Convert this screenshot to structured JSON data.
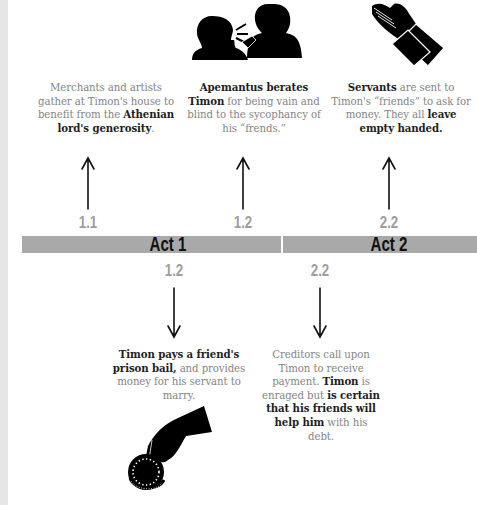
{
  "colors": {
    "act_bar": "#a9a9a9",
    "scene_number": "#9d9d9d",
    "body_text": "#858585",
    "emphasis_text": "#1e1e1e",
    "background": "#ffffff"
  },
  "acts": [
    {
      "label": "Act 1"
    },
    {
      "label": "Act 2"
    }
  ],
  "events_above": [
    {
      "scene": "1.1",
      "icon": "none",
      "parts": [
        {
          "text": "Merchants and artists gather at Timon's house to benefit from the ",
          "bold": false
        },
        {
          "text": "Athenian lord's generosity",
          "bold": true
        },
        {
          "text": ".",
          "bold": false
        }
      ]
    },
    {
      "scene": "1.2",
      "icon": "shouting-man-icon",
      "parts": [
        {
          "text": "Apemantus berates Timon",
          "bold": true
        },
        {
          "text": " for being vain and blind to the sycophancy of his “frends.”",
          "bold": false
        }
      ]
    },
    {
      "scene": "2.2",
      "icon": "begging-hands-icon",
      "parts": [
        {
          "text": "Servants",
          "bold": true
        },
        {
          "text": " are sent to Timon's “friends” to ask for money. They all ",
          "bold": false
        },
        {
          "text": "leave empty handed.",
          "bold": true
        }
      ]
    }
  ],
  "events_below": [
    {
      "scene": "1.2",
      "icon": "hand-with-coin-icon",
      "parts": [
        {
          "text": "Timon pays a friend's prison bail,",
          "bold": true
        },
        {
          "text": " and provides money for his servant to marry.",
          "bold": false
        }
      ]
    },
    {
      "scene": "2.2",
      "icon": "none",
      "parts": [
        {
          "text": "Creditors call upon Timon to receive payment. ",
          "bold": false
        },
        {
          "text": "Timon",
          "bold": true
        },
        {
          "text": " is enraged but ",
          "bold": false
        },
        {
          "text": "is certain that his friends will help him",
          "bold": true
        },
        {
          "text": " with his debt.",
          "bold": false
        }
      ]
    }
  ]
}
